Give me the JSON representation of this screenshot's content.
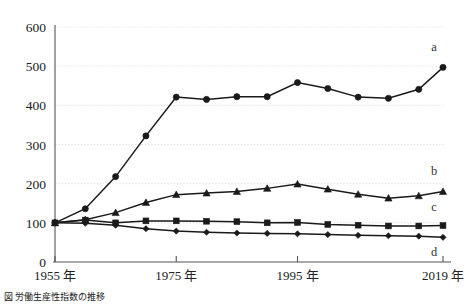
{
  "figure": {
    "caption": "図  労働生産性指数の推移",
    "background_color": "#ffffff",
    "line_color": "#1a1a1a",
    "grid_color": "#dddddd"
  },
  "chart_data": {
    "type": "line",
    "title": "",
    "xlabel": "",
    "ylabel": "",
    "ylim": [
      0,
      600
    ],
    "xlim": [
      1955,
      2019
    ],
    "grid": true,
    "legend_position": "right-inline",
    "y_ticks": [
      0,
      100,
      200,
      300,
      400,
      500,
      600
    ],
    "y_tick_labels": [
      "0",
      "100",
      "200",
      "300",
      "400",
      "500",
      "600"
    ],
    "x_ticks": [
      1955,
      1975,
      1995,
      2019
    ],
    "x_tick_labels": [
      "1955 年",
      "1975 年",
      "1995 年",
      "2019 年"
    ],
    "x": [
      1955,
      1960,
      1965,
      1970,
      1975,
      1980,
      1985,
      1990,
      1995,
      2000,
      2005,
      2010,
      2015,
      2019
    ],
    "series": [
      {
        "name": "a",
        "label": "a",
        "marker": "circle",
        "values": [
          100,
          136,
          218,
          322,
          421,
          415,
          422,
          422,
          458,
          443,
          421,
          418,
          441,
          497
        ]
      },
      {
        "name": "b",
        "label": "b",
        "marker": "triangle",
        "values": [
          100,
          108,
          126,
          152,
          172,
          176,
          180,
          188,
          199,
          186,
          173,
          163,
          169,
          180
        ]
      },
      {
        "name": "c",
        "label": "c",
        "marker": "square",
        "values": [
          100,
          107,
          100,
          105,
          105,
          104,
          103,
          100,
          101,
          96,
          94,
          92,
          92,
          93
        ]
      },
      {
        "name": "d",
        "label": "d",
        "marker": "diamond",
        "values": [
          100,
          99,
          94,
          85,
          79,
          76,
          74,
          73,
          72,
          70,
          68,
          67,
          66,
          63
        ]
      }
    ]
  }
}
